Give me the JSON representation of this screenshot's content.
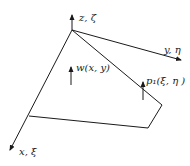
{
  "diagram": {
    "colors": {
      "line": "#1a1a1a",
      "background": "#ffffff"
    },
    "axes": {
      "z": {
        "label": "z, ζ"
      },
      "y": {
        "label": "y,  η"
      },
      "x": {
        "label": "x, ξ"
      }
    },
    "quantities": {
      "deflection": {
        "label": "w(x, y)"
      },
      "load": {
        "label": "p₁(ξ, η )"
      }
    }
  }
}
